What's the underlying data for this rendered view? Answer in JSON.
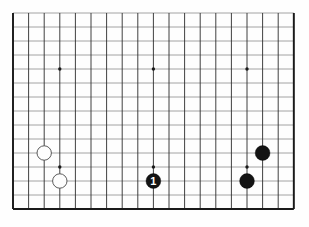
{
  "figure": {
    "kind": "go-board-diagram",
    "background_color": "#fefefe"
  },
  "board": {
    "visible_columns": 19,
    "visible_rows": 15,
    "origin_x": 13,
    "origin_y": 13,
    "cell_width": 15.6,
    "cell_height": 14.0,
    "vertical_line_color": "#2b2b2b",
    "horizontal_line_color": "#9a9a9a",
    "edge_color": "#1a1a1a",
    "edge_width": 1.9,
    "line_width": 0.9
  },
  "star_points": [
    {
      "col": 3,
      "row": 4,
      "radius": 1.7
    },
    {
      "col": 9,
      "row": 4,
      "radius": 1.7
    },
    {
      "col": 15,
      "row": 4,
      "radius": 1.7
    },
    {
      "col": 3,
      "row": 11,
      "radius": 1.7
    },
    {
      "col": 9,
      "row": 11,
      "radius": 1.7
    },
    {
      "col": 15,
      "row": 11,
      "radius": 1.7
    }
  ],
  "stones": [
    {
      "id": "white-stone-a",
      "color": "white",
      "col": 2,
      "row": 10,
      "radius": 7.2,
      "fill": "#fdfdfd",
      "stroke": "#4a4a4a",
      "marker": ""
    },
    {
      "id": "white-stone-b",
      "color": "white",
      "col": 3,
      "row": 12,
      "radius": 7.2,
      "fill": "#fdfdfd",
      "stroke": "#4a4a4a",
      "marker": ""
    },
    {
      "id": "black-stone-marked-1",
      "color": "black",
      "col": 9,
      "row": 12,
      "radius": 7.4,
      "fill": "#141414",
      "stroke": "#000000",
      "marker": "1"
    },
    {
      "id": "black-stone-b",
      "color": "black",
      "col": 15,
      "row": 12,
      "radius": 7.4,
      "fill": "#141414",
      "stroke": "#000000",
      "marker": ""
    },
    {
      "id": "black-stone-c",
      "color": "black",
      "col": 16,
      "row": 10,
      "radius": 7.4,
      "fill": "#141414",
      "stroke": "#000000",
      "marker": ""
    }
  ]
}
